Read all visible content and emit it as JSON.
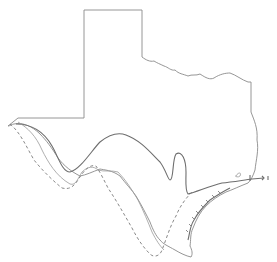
{
  "map": {
    "subject": "Texas state outline",
    "features": [
      {
        "name": "state-border",
        "style": "solid-thin"
      },
      {
        "name": "range-boundary-solid",
        "style": "solid"
      },
      {
        "name": "range-boundary-thin",
        "style": "solid-thin"
      },
      {
        "name": "range-boundary-dashed",
        "style": "dashed"
      },
      {
        "name": "coastal-line",
        "style": "solid-with-ticks"
      }
    ],
    "colors": {
      "background": "#ffffff",
      "line": "#7a7a7a"
    }
  }
}
